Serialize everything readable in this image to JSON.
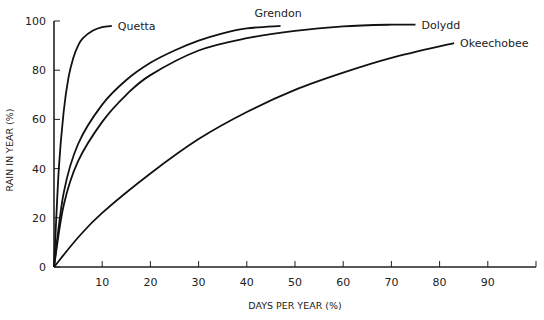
{
  "chart_data": {
    "type": "line",
    "title": "",
    "xlabel": "DAYS PER YEAR (%)",
    "ylabel": "RAIN IN YEAR (%)",
    "xlim": [
      0,
      100
    ],
    "ylim": [
      0,
      100
    ],
    "x_ticks": [
      10,
      20,
      30,
      40,
      50,
      60,
      70,
      80,
      90
    ],
    "x_tick_labels": [
      "10",
      "20",
      "30",
      "40",
      "50",
      "60",
      "70",
      "80",
      "90"
    ],
    "y_ticks": [
      0,
      20,
      40,
      60,
      80,
      100
    ],
    "y_tick_labels": [
      "0",
      "20",
      "40",
      "60",
      "80",
      "100"
    ],
    "grid": false,
    "legend": "inline labels at line ends",
    "series": [
      {
        "name": "Quetta",
        "x": [
          0,
          1,
          2,
          3,
          4,
          5,
          6,
          8,
          10,
          12
        ],
        "y": [
          0,
          40,
          63,
          77,
          85,
          90,
          93,
          96,
          97.5,
          98
        ]
      },
      {
        "name": "Grendon",
        "x": [
          0,
          2,
          5,
          10,
          15,
          20,
          25,
          30,
          35,
          40,
          47
        ],
        "y": [
          0,
          30,
          50,
          66,
          76,
          83,
          88,
          92,
          95,
          97,
          98
        ]
      },
      {
        "name": "Dolydd",
        "x": [
          0,
          2,
          5,
          10,
          15,
          20,
          30,
          40,
          50,
          60,
          70,
          75
        ],
        "y": [
          0,
          25,
          43,
          59,
          70,
          78,
          88,
          93,
          96,
          97.8,
          98.5,
          98.5
        ]
      },
      {
        "name": "Okeechobee",
        "x": [
          0,
          5,
          10,
          20,
          30,
          40,
          50,
          60,
          70,
          83
        ],
        "y": [
          0,
          12,
          22,
          38,
          52,
          63,
          72,
          79,
          85,
          91
        ]
      }
    ]
  }
}
